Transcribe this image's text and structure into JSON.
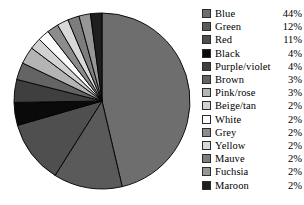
{
  "chart_data": {
    "type": "pie",
    "title": "",
    "subtitle": "",
    "xlabel": "",
    "ylabel": "",
    "legend_position": "right",
    "grid": false,
    "start_angle_deg": 0,
    "direction": "clockwise",
    "categories": [
      "Blue",
      "Green",
      "Red",
      "Black",
      "Purple/violet",
      "Brown",
      "Pink/rose",
      "Beige/tan",
      "White",
      "Grey",
      "Yellow",
      "Mauve",
      "Fuchsia",
      "Maroon"
    ],
    "values": [
      44,
      12,
      11,
      4,
      4,
      3,
      3,
      2,
      2,
      2,
      2,
      2,
      2,
      2
    ],
    "value_labels": [
      "44%",
      "12%",
      "11%",
      "4%",
      "4%",
      "3%",
      "3%",
      "2%",
      "2%",
      "2%",
      "2%",
      "2%",
      "2%",
      "2%"
    ],
    "unit": "%",
    "slice_colors": [
      "#6e6e6e",
      "#5a5a5a",
      "#4f4f4f",
      "#0a0a0a",
      "#3f3f3f",
      "#646464",
      "#b4b4b4",
      "#d2d2d2",
      "#fbfbfb",
      "#8c8c8c",
      "#d8d8d8",
      "#7d7d7d",
      "#969696",
      "#1e1e1e"
    ],
    "slice_outline_color": "#000000"
  },
  "legend": {
    "rows": [
      {
        "label": "Blue",
        "value": "44%",
        "swatch": "#6e6e6e"
      },
      {
        "label": "Green",
        "value": "12%",
        "swatch": "#5a5a5a"
      },
      {
        "label": "Red",
        "value": "11%",
        "swatch": "#4f4f4f"
      },
      {
        "label": "Black",
        "value": "4%",
        "swatch": "#0a0a0a"
      },
      {
        "label": "Purple/violet",
        "value": "4%",
        "swatch": "#3f3f3f"
      },
      {
        "label": "Brown",
        "value": "3%",
        "swatch": "#646464"
      },
      {
        "label": "Pink/rose",
        "value": "3%",
        "swatch": "#b4b4b4"
      },
      {
        "label": "Beige/tan",
        "value": "2%",
        "swatch": "#d2d2d2"
      },
      {
        "label": "White",
        "value": "2%",
        "swatch": "#fbfbfb"
      },
      {
        "label": "Grey",
        "value": "2%",
        "swatch": "#8c8c8c"
      },
      {
        "label": "Yellow",
        "value": "2%",
        "swatch": "#d8d8d8"
      },
      {
        "label": "Mauve",
        "value": "2%",
        "swatch": "#7d7d7d"
      },
      {
        "label": "Fuchsia",
        "value": "2%",
        "swatch": "#969696"
      },
      {
        "label": "Maroon",
        "value": "2%",
        "swatch": "#1e1e1e"
      }
    ]
  },
  "geometry": {
    "center_x": 102,
    "center_y": 101,
    "radius": 88
  }
}
